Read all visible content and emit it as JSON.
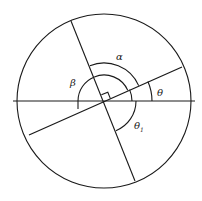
{
  "diagram": {
    "title": "",
    "labels": {
      "alpha": "α",
      "beta": "β",
      "theta": "θ",
      "theta1_main": "θ",
      "theta1_sub": "1"
    },
    "colors": {
      "stroke": "#1a1a1a",
      "background": "#ffffff"
    }
  }
}
